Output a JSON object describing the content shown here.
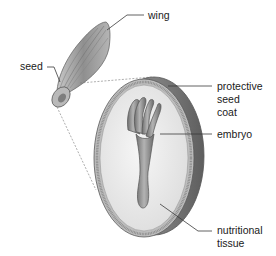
{
  "labels": {
    "wing": "wing",
    "seed": "seed",
    "protective_seed_coat": [
      "protective",
      "seed",
      "coat"
    ],
    "embryo": "embryo",
    "nutritional_tissue": [
      "nutritional",
      "tissue"
    ]
  },
  "colors": {
    "text": "#1a1a1a",
    "leader_line": "#3a3a3a",
    "wing_fill": "#9a9a9a",
    "coat_edge": "#6e6e6e",
    "tissue_fill": "#ececec",
    "embryo_fill": "#8c8c8c"
  }
}
